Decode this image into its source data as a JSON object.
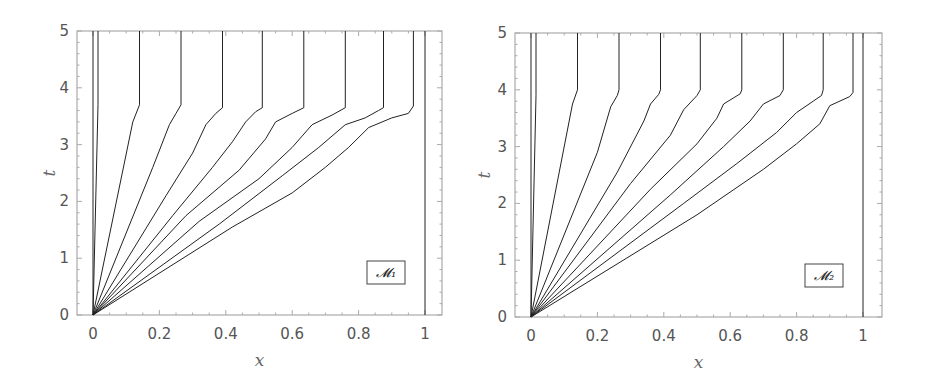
{
  "chart_data": [
    {
      "type": "line",
      "title": "",
      "legend": "M1",
      "legend_display": "𝓜₁",
      "xlabel": "x",
      "ylabel": "t",
      "xlim": [
        -0.05,
        1.05
      ],
      "ylim": [
        0,
        5
      ],
      "xticks": [
        "0",
        "0.2",
        "0.4",
        "0.6",
        "0.8",
        "1"
      ],
      "yticks": [
        "0",
        "1",
        "2",
        "3",
        "4",
        "5"
      ],
      "grid": false,
      "series": [
        {
          "name": "curve-0",
          "points": [
            [
              0,
              0
            ],
            [
              0,
              5
            ]
          ]
        },
        {
          "name": "curve-1",
          "points": [
            [
              0,
              0
            ],
            [
              0.015,
              3.7
            ],
            [
              0.015,
              5
            ]
          ]
        },
        {
          "name": "curve-2",
          "points": [
            [
              0,
              0
            ],
            [
              0.12,
              3.4
            ],
            [
              0.14,
              3.7
            ],
            [
              0.14,
              5
            ]
          ]
        },
        {
          "name": "curve-3",
          "points": [
            [
              0,
              0
            ],
            [
              0.18,
              2.6
            ],
            [
              0.23,
              3.35
            ],
            [
              0.25,
              3.55
            ],
            [
              0.265,
              3.7
            ],
            [
              0.265,
              5
            ]
          ]
        },
        {
          "name": "curve-4",
          "points": [
            [
              0,
              0
            ],
            [
              0.22,
              2.1
            ],
            [
              0.3,
              2.85
            ],
            [
              0.34,
              3.35
            ],
            [
              0.37,
              3.55
            ],
            [
              0.39,
              3.65
            ],
            [
              0.39,
              5
            ]
          ]
        },
        {
          "name": "curve-5",
          "points": [
            [
              0,
              0
            ],
            [
              0.24,
              1.75
            ],
            [
              0.36,
              2.6
            ],
            [
              0.42,
              3.05
            ],
            [
              0.46,
              3.4
            ],
            [
              0.49,
              3.58
            ],
            [
              0.51,
              3.65
            ],
            [
              0.51,
              5
            ]
          ]
        },
        {
          "name": "curve-6",
          "points": [
            [
              0,
              0
            ],
            [
              0.28,
              1.75
            ],
            [
              0.44,
              2.55
            ],
            [
              0.52,
              3.1
            ],
            [
              0.55,
              3.4
            ],
            [
              0.6,
              3.55
            ],
            [
              0.635,
              3.65
            ],
            [
              0.635,
              5
            ]
          ]
        },
        {
          "name": "curve-7",
          "points": [
            [
              0,
              0
            ],
            [
              0.32,
              1.65
            ],
            [
              0.5,
              2.4
            ],
            [
              0.6,
              2.95
            ],
            [
              0.66,
              3.35
            ],
            [
              0.72,
              3.52
            ],
            [
              0.76,
              3.65
            ],
            [
              0.76,
              5
            ]
          ]
        },
        {
          "name": "curve-8",
          "points": [
            [
              0,
              0
            ],
            [
              0.38,
              1.6
            ],
            [
              0.57,
              2.45
            ],
            [
              0.68,
              2.95
            ],
            [
              0.76,
              3.35
            ],
            [
              0.82,
              3.47
            ],
            [
              0.86,
              3.6
            ],
            [
              0.875,
              3.65
            ],
            [
              0.875,
              5
            ]
          ]
        },
        {
          "name": "curve-9",
          "points": [
            [
              0,
              0
            ],
            [
              0.42,
              1.55
            ],
            [
              0.6,
              2.15
            ],
            [
              0.7,
              2.6
            ],
            [
              0.77,
              2.95
            ],
            [
              0.83,
              3.3
            ],
            [
              0.9,
              3.47
            ],
            [
              0.95,
              3.55
            ],
            [
              0.965,
              3.68
            ],
            [
              0.965,
              5
            ]
          ]
        },
        {
          "name": "curve-10",
          "points": [
            [
              1,
              0
            ],
            [
              1,
              5
            ]
          ]
        }
      ]
    },
    {
      "type": "line",
      "title": "",
      "legend": "M2",
      "legend_display": "𝓜₂",
      "xlabel": "x",
      "ylabel": "t",
      "xlim": [
        -0.05,
        1.05
      ],
      "ylim": [
        0,
        5
      ],
      "xticks": [
        "0",
        "0.2",
        "0.4",
        "0.6",
        "0.8",
        "1"
      ],
      "yticks": [
        "0",
        "1",
        "2",
        "3",
        "4",
        "5"
      ],
      "grid": false,
      "series": [
        {
          "name": "curve-0",
          "points": [
            [
              0,
              0
            ],
            [
              0,
              5
            ]
          ]
        },
        {
          "name": "curve-1",
          "points": [
            [
              0,
              0
            ],
            [
              0.015,
              3.9
            ],
            [
              0.015,
              5
            ]
          ]
        },
        {
          "name": "curve-2",
          "points": [
            [
              0,
              0
            ],
            [
              0.125,
              3.75
            ],
            [
              0.14,
              4.0
            ],
            [
              0.14,
              5
            ]
          ]
        },
        {
          "name": "curve-3",
          "points": [
            [
              0,
              0
            ],
            [
              0.2,
              2.9
            ],
            [
              0.24,
              3.7
            ],
            [
              0.26,
              3.9
            ],
            [
              0.265,
              4.0
            ],
            [
              0.265,
              5
            ]
          ]
        },
        {
          "name": "curve-4",
          "points": [
            [
              0,
              0
            ],
            [
              0.26,
              2.55
            ],
            [
              0.34,
              3.45
            ],
            [
              0.36,
              3.75
            ],
            [
              0.385,
              3.92
            ],
            [
              0.39,
              4.0
            ],
            [
              0.39,
              5
            ]
          ]
        },
        {
          "name": "curve-5",
          "points": [
            [
              0,
              0
            ],
            [
              0.3,
              2.35
            ],
            [
              0.42,
              3.2
            ],
            [
              0.46,
              3.65
            ],
            [
              0.5,
              3.9
            ],
            [
              0.51,
              4.0
            ],
            [
              0.51,
              5
            ]
          ]
        },
        {
          "name": "curve-6",
          "points": [
            [
              0,
              0
            ],
            [
              0.36,
              2.25
            ],
            [
              0.5,
              3.05
            ],
            [
              0.56,
              3.5
            ],
            [
              0.58,
              3.75
            ],
            [
              0.63,
              3.93
            ],
            [
              0.635,
              4.0
            ],
            [
              0.635,
              5
            ]
          ]
        },
        {
          "name": "curve-7",
          "points": [
            [
              0,
              0
            ],
            [
              0.42,
              2.15
            ],
            [
              0.58,
              3.0
            ],
            [
              0.66,
              3.45
            ],
            [
              0.7,
              3.75
            ],
            [
              0.75,
              3.9
            ],
            [
              0.76,
              4.0
            ],
            [
              0.76,
              5
            ]
          ]
        },
        {
          "name": "curve-8",
          "points": [
            [
              0,
              0
            ],
            [
              0.46,
              2.0
            ],
            [
              0.62,
              2.7
            ],
            [
              0.74,
              3.25
            ],
            [
              0.8,
              3.6
            ],
            [
              0.85,
              3.8
            ],
            [
              0.875,
              3.9
            ],
            [
              0.88,
              4.0
            ],
            [
              0.88,
              5
            ]
          ]
        },
        {
          "name": "curve-9",
          "points": [
            [
              0,
              0
            ],
            [
              0.5,
              1.8
            ],
            [
              0.7,
              2.6
            ],
            [
              0.8,
              3.05
            ],
            [
              0.87,
              3.4
            ],
            [
              0.9,
              3.72
            ],
            [
              0.96,
              3.88
            ],
            [
              0.97,
              3.95
            ],
            [
              0.97,
              5
            ]
          ]
        },
        {
          "name": "curve-10",
          "points": [
            [
              1,
              0
            ],
            [
              1,
              5
            ]
          ]
        }
      ]
    }
  ],
  "panels": [
    {
      "legend": "𝓜₁",
      "xlabel": "x",
      "ylabel": "t"
    },
    {
      "legend": "𝓜₂",
      "xlabel": "x",
      "ylabel": "t"
    }
  ]
}
